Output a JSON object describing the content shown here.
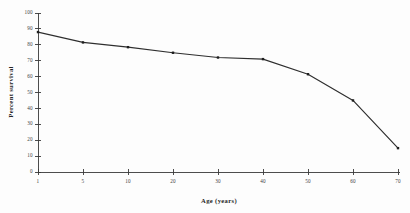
{
  "chart_data": {
    "type": "line",
    "title": "",
    "xlabel": "Age (years)",
    "ylabel": "Percent survival",
    "categories": [
      "1",
      "5",
      "10",
      "20",
      "30",
      "40",
      "50",
      "60",
      "70"
    ],
    "values": [
      88,
      81.5,
      78.5,
      75,
      72,
      71,
      61.5,
      45,
      15
    ],
    "series": [
      {
        "name": "Percent survival",
        "values": [
          88,
          81.5,
          78.5,
          75,
          72,
          71,
          61.5,
          45,
          15
        ]
      }
    ],
    "ylim": [
      0,
      100
    ],
    "yticks": [
      0,
      10,
      20,
      30,
      40,
      50,
      60,
      70,
      80,
      90,
      100
    ],
    "ytick_labels": [
      "0",
      "10",
      "20",
      "30",
      "40",
      "50",
      "60",
      "70",
      "80",
      "90",
      "100"
    ],
    "xtick_labels": [
      "1",
      "5",
      "10",
      "20",
      "30",
      "40",
      "50",
      "60",
      "70"
    ],
    "grid": false,
    "legend": false,
    "marker": "square",
    "line_color": "#2e2e2e",
    "marker_color": "#1e1e1e",
    "axis_color": "#3a3a3a",
    "background_color": "#fdfdfd"
  }
}
